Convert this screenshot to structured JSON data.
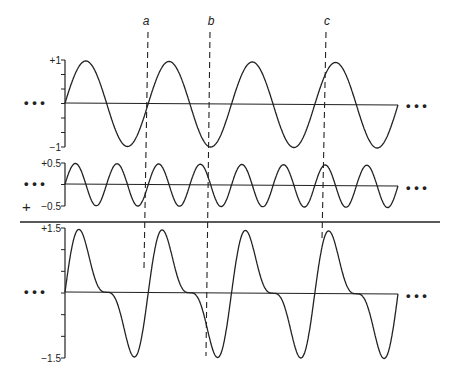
{
  "figure": {
    "markers": [
      {
        "label": "a",
        "x": 148
      },
      {
        "label": "b",
        "x": 210
      },
      {
        "label": "c",
        "x": 326
      }
    ],
    "panels": [
      {
        "name": "fundamental",
        "ticks": {
          "top": "+1",
          "bottom": "−1"
        },
        "amplitude": 1,
        "cycles": 4,
        "y_top": 60,
        "y_base": 103,
        "y_bottom": 147
      },
      {
        "name": "second-harmonic",
        "ticks": {
          "top": "+0.5",
          "bottom": "−0.5"
        },
        "extra_mark": "+",
        "amplitude": 0.5,
        "cycles": 8,
        "y_top": 163,
        "y_base": 184,
        "y_bottom": 206
      },
      {
        "name": "sum",
        "ticks": {
          "top": "+1.5",
          "bottom": "−1.5"
        },
        "amplitude": 1.5,
        "cycles": 4,
        "y_top": 228,
        "y_base": 292,
        "y_bottom": 358
      }
    ],
    "ellipsis": "• • •",
    "x_start": 65,
    "x_end": 398,
    "colors": {
      "ink": "#222222",
      "background": "#ffffff"
    }
  }
}
